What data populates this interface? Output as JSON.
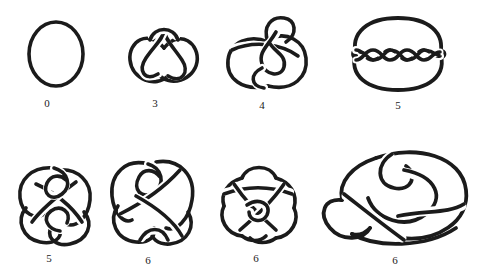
{
  "plate": {
    "title": "Table of prime knots by crossing number",
    "background_color": "#ffffff",
    "ink_color": "#1b1b1b",
    "width": 480,
    "height": 278,
    "rows": 2,
    "columns": 4
  },
  "knots": [
    {
      "id": "unknot",
      "label": "0",
      "name": "unknot",
      "crossing_number": 0,
      "row": 1,
      "column": 1,
      "label_x": 47,
      "label_y": 98
    },
    {
      "id": "trefoil",
      "label": "3",
      "name": "trefoil-knot",
      "crossing_number": 3,
      "row": 1,
      "column": 2,
      "label_x": 155,
      "label_y": 98
    },
    {
      "id": "figure-eight",
      "label": "4",
      "name": "figure-eight-knot",
      "crossing_number": 4,
      "row": 1,
      "column": 3,
      "label_x": 262,
      "label_y": 102
    },
    {
      "id": "cinquefoil",
      "label": "5",
      "name": "cinquefoil-knot",
      "crossing_number": 5,
      "row": 1,
      "column": 4,
      "label_x": 398,
      "label_y": 102
    },
    {
      "id": "three-twist",
      "label": "5",
      "name": "three-twist-knot",
      "crossing_number": 5,
      "row": 2,
      "column": 1,
      "label_x": 49,
      "label_y": 253
    },
    {
      "id": "six-one",
      "label": "6",
      "name": "stevedore-knot",
      "crossing_number": 6,
      "row": 2,
      "column": 2,
      "label_x": 148,
      "label_y": 255
    },
    {
      "id": "six-two",
      "label": "6",
      "name": "six-two-knot",
      "crossing_number": 6,
      "row": 2,
      "column": 3,
      "label_x": 256,
      "label_y": 253
    },
    {
      "id": "six-three",
      "label": "6",
      "name": "six-three-knot",
      "crossing_number": 6,
      "row": 2,
      "column": 4,
      "label_x": 395,
      "label_y": 255
    }
  ]
}
